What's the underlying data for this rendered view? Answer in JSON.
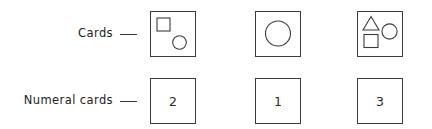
{
  "figure": {
    "rows": [
      {
        "id": "cards-row",
        "label": "Cards",
        "arrow": "arrow-right-icon",
        "cards": [
          {
            "id": "card-1",
            "shape_count": 2,
            "shapes": [
              {
                "type": "square",
                "position": "upper-left"
              },
              {
                "type": "circle",
                "position": "lower-right"
              }
            ]
          },
          {
            "id": "card-2",
            "shape_count": 1,
            "shapes": [
              {
                "type": "circle",
                "position": "center"
              }
            ]
          },
          {
            "id": "card-3",
            "shape_count": 3,
            "shapes": [
              {
                "type": "triangle",
                "position": "upper-left"
              },
              {
                "type": "circle",
                "position": "right"
              },
              {
                "type": "square",
                "position": "lower-left"
              }
            ]
          }
        ]
      },
      {
        "id": "numeral-cards-row",
        "label": "Numeral cards",
        "arrow": "arrow-right-icon",
        "cards": [
          {
            "id": "numeral-card-1",
            "numeral": "2"
          },
          {
            "id": "numeral-card-2",
            "numeral": "1"
          },
          {
            "id": "numeral-card-3",
            "numeral": "3"
          }
        ]
      }
    ]
  },
  "colors": {
    "ink": "#3b3b3b",
    "text": "#222222",
    "background": "#ffffff"
  }
}
